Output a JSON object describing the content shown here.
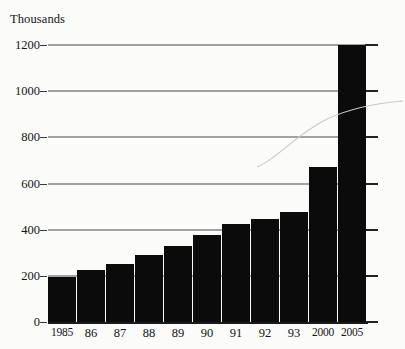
{
  "chart_data": {
    "type": "bar",
    "title": "",
    "ylabel": "Thousands",
    "xlabel": "",
    "categories": [
      "1985",
      "86",
      "87",
      "88",
      "89",
      "90",
      "91",
      "92",
      "93",
      "2000",
      "2005"
    ],
    "values": [
      195,
      225,
      250,
      290,
      330,
      375,
      425,
      445,
      475,
      670,
      1200
    ],
    "ylim": [
      0,
      1200
    ],
    "yticks": [
      0,
      200,
      400,
      600,
      800,
      1000,
      1200
    ],
    "ytick_labels": [
      "0",
      "200",
      "400",
      "600",
      "800",
      "1000",
      "1200"
    ],
    "grid": true,
    "legend": null,
    "bar_color": "#0b0b0b",
    "grid_color": "#4a4a4a",
    "background_color": "#fbfbfa",
    "text_color": "#141414"
  }
}
